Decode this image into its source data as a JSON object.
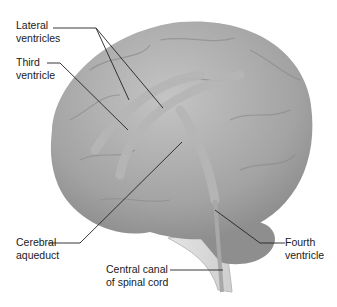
{
  "diagram": {
    "labels": [
      {
        "id": "lateral",
        "line1": "Lateral",
        "line2": "ventricles"
      },
      {
        "id": "third",
        "line1": "Third",
        "line2": "ventricle"
      },
      {
        "id": "aqueduct",
        "line1": "Cerebral",
        "line2": "aqueduct"
      },
      {
        "id": "central",
        "line1": "Central canal",
        "line2": "of spinal cord"
      },
      {
        "id": "fourth",
        "line1": "Fourth",
        "line2": "ventricle"
      }
    ],
    "colors": {
      "brain": "#9a9a9a",
      "brain_light": "#bdbdbd",
      "ventricle": "#b4b4b4",
      "line": "#222222"
    }
  }
}
